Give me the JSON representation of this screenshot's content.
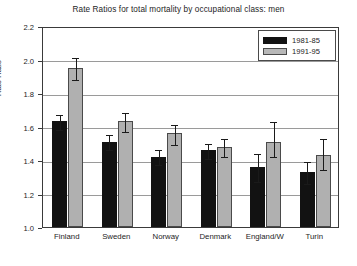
{
  "chart_data": {
    "type": "bar",
    "title": "Rate Ratios for total mortality by occupational class: men",
    "xlabel": "",
    "ylabel": "Rate Ratio",
    "ylim": [
      1.0,
      2.2
    ],
    "ytick_step": 0.2,
    "yticks": [
      "2.2",
      "2.0",
      "1.8",
      "1.6",
      "1.4",
      "1.2",
      "1.0"
    ],
    "grid": true,
    "legend_position": "top-right",
    "categories": [
      "Finland",
      "Sweden",
      "Norway",
      "Denmark",
      "England/W",
      "Turin"
    ],
    "series": [
      {
        "name": "1981-85",
        "color": "#121212",
        "values": [
          1.63,
          1.51,
          1.42,
          1.46,
          1.36,
          1.33
        ],
        "error_low": [
          1.59,
          1.47,
          1.38,
          1.42,
          1.28,
          1.27
        ],
        "error_high": [
          1.68,
          1.56,
          1.47,
          1.51,
          1.45,
          1.4
        ]
      },
      {
        "name": "1991-95",
        "color": "#b0b0b0",
        "values": [
          1.95,
          1.63,
          1.56,
          1.48,
          1.51,
          1.43
        ],
        "error_low": [
          1.89,
          1.58,
          1.5,
          1.43,
          1.43,
          1.35
        ],
        "error_high": [
          2.02,
          1.69,
          1.62,
          1.54,
          1.64,
          1.54
        ]
      }
    ]
  }
}
